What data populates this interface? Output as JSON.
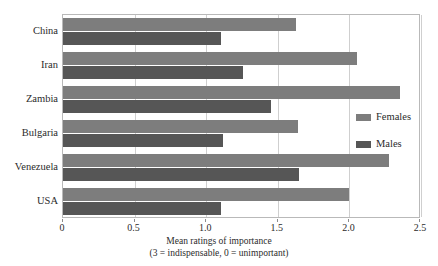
{
  "chart_data": {
    "type": "bar",
    "orientation": "horizontal",
    "title": "",
    "xlabel": "Mean ratings of importance",
    "xlabel_line2": "(3 = indispensable, 0 = unimportant)",
    "ylabel": "",
    "xlim": [
      0,
      2.5
    ],
    "xticks": [
      0,
      0.5,
      1.0,
      1.5,
      2.0,
      2.5
    ],
    "xtick_labels": [
      "0",
      "0.5",
      "1.0",
      "1.5",
      "2.0",
      "2.5"
    ],
    "grid": true,
    "grid_axis": "x",
    "legend_position": "right",
    "categories": [
      "China",
      "Iran",
      "Zambia",
      "Bulgaria",
      "Venezuela",
      "USA"
    ],
    "series": [
      {
        "name": "Females",
        "color": "#7d7d7d",
        "values": [
          1.63,
          2.05,
          2.35,
          1.64,
          2.28,
          2.0
        ]
      },
      {
        "name": "Males",
        "color": "#565656",
        "values": [
          1.1,
          1.26,
          1.45,
          1.12,
          1.65,
          1.1
        ]
      }
    ]
  },
  "legend": {
    "entries": [
      {
        "label": "Females",
        "swatch": "females"
      },
      {
        "label": "Males",
        "swatch": "males"
      }
    ]
  },
  "colors": {
    "females_bar": "#7d7d7d",
    "males_bar": "#565656",
    "gridline": "#cfcfcf",
    "frame": "#b9b9b9",
    "text": "#2b2b2b",
    "background": "#ffffff"
  }
}
